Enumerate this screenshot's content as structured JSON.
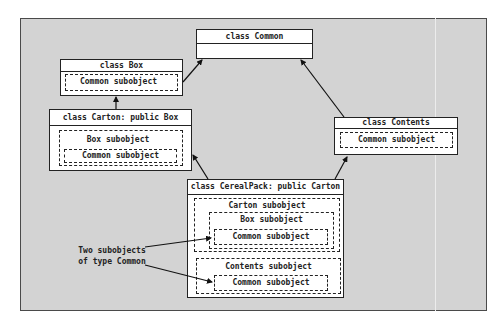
{
  "diagram": {
    "type": "class-inheritance-object-layout",
    "classes": {
      "common": {
        "title": "class Common"
      },
      "box": {
        "title": "class Box",
        "subobjects": [
          "Common subobject"
        ]
      },
      "carton": {
        "title": "class Carton: public Box",
        "subobjects": [
          "Box subobject",
          "Common subobject"
        ]
      },
      "contents": {
        "title": "class Contents",
        "subobjects": [
          "Common subobject"
        ]
      },
      "cerealpack": {
        "title": "class CerealPack: public Carton",
        "carton_sub": "Carton subobject",
        "box_sub": "Box subobject",
        "common_sub_1": "Common subobject",
        "contents_sub": "Contents subobject",
        "common_sub_2": "Common subobject"
      }
    },
    "callout": {
      "line1": "Two subobjects",
      "line2": "of type Common"
    },
    "edges": [
      {
        "from": "Box",
        "to": "Common"
      },
      {
        "from": "Carton",
        "to": "Box"
      },
      {
        "from": "Contents",
        "to": "Common"
      },
      {
        "from": "CerealPack",
        "to": "Carton"
      },
      {
        "from": "CerealPack",
        "to": "Contents"
      },
      {
        "from": "callout",
        "to": "CerealPack.Carton.Box.Common"
      },
      {
        "from": "callout",
        "to": "CerealPack.Contents.Common"
      }
    ],
    "colors": {
      "background": "#d3d3d3",
      "box_fill": "#ffffff",
      "stroke": "#222222"
    }
  }
}
